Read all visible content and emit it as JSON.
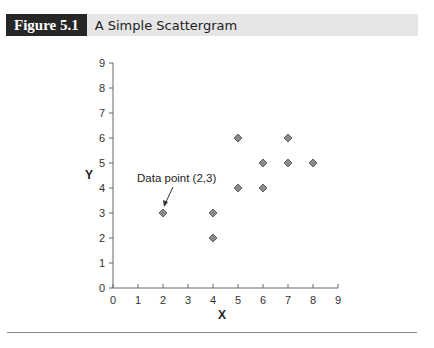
{
  "figure": {
    "label": "Figure 5.1",
    "title": "A Simple Scattergram"
  },
  "chart_data": {
    "type": "scatter",
    "title": "A Simple Scattergram",
    "xlabel": "X",
    "ylabel": "Y",
    "xlim": [
      0,
      9
    ],
    "ylim": [
      0,
      9
    ],
    "x_ticks": [
      0,
      1,
      2,
      3,
      4,
      5,
      6,
      7,
      8,
      9
    ],
    "y_ticks": [
      0,
      1,
      2,
      3,
      4,
      5,
      6,
      7,
      8,
      9
    ],
    "grid": false,
    "points": [
      {
        "x": 2,
        "y": 3
      },
      {
        "x": 4,
        "y": 3
      },
      {
        "x": 4,
        "y": 2
      },
      {
        "x": 5,
        "y": 6
      },
      {
        "x": 5,
        "y": 4
      },
      {
        "x": 6,
        "y": 5
      },
      {
        "x": 6,
        "y": 4
      },
      {
        "x": 7,
        "y": 6
      },
      {
        "x": 7,
        "y": 5
      },
      {
        "x": 8,
        "y": 5
      }
    ],
    "annotations": [
      {
        "text": "Data point (2,3)",
        "target": {
          "x": 2,
          "y": 3
        }
      }
    ],
    "marker": "diamond",
    "marker_color": "#8a8a8a"
  }
}
